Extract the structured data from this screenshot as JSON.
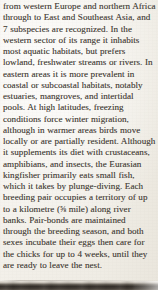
{
  "page": {
    "kind": "scanned-book-page-excerpt",
    "paper_color": "#f3f0ea",
    "ink_color": "#4c4740",
    "photo_band_color": "#342f2a"
  },
  "body": {
    "text": "from western Europe and northern Africa through to East and Southeast Asia, and 7 subspecies are recognized. In the western sector of its range it inhabits most aquatic habitats, but prefers lowland, freshwater streams or rivers. In eastern areas it is more prevalent in coastal or subcoastal habitats, notably estuaries, mangroves, and intertidal pools. At high latitudes, freezing conditions force winter migration, although in warmer areas birds move locally or are partially resident. Although it supplements its diet with crustaceans, amphibians, and insects, the Eurasian kingfisher primarily eats small fish, which it takes by plunge-diving. Each breeding pair occupies a territory of up to a kilometre (",
    "fraction": "⅝",
    "text_after_fraction": " mile) along river banks. Pair-bonds are maintained through the breeding season, and both sexes incubate their eggs then care for the chicks for up to 4 weeks, until they are ready to leave the nest.",
    "lines": [
      "from western Europe and northern",
      "Africa through to East and Southeast",
      "Asia, and 7 subspecies are recognized.",
      "In the western sector of its range it",
      "inhabits most aquatic habitats, but",
      "prefers lowland, freshwater streams",
      "or rivers. In eastern areas it is more",
      "prevalent in coastal or subcoastal",
      "habitats, notably estuaries, mangroves,",
      "and intertidal pools. At high latitudes,",
      "freezing conditions force winter",
      "migration, although in warmer areas",
      "birds move locally or are partially",
      "resident. Although it supplements its",
      "diet with crustaceans, amphibians,",
      "and insects, the Eurasian kingfisher",
      "primarily eats small fish, which it",
      "takes by plunge-diving. Each breeding",
      "pair occupies a territory of up to a",
      "kilometre (⅝ mile) along river banks.",
      "Pair-bonds are maintained through",
      "the breeding season, and both sexes",
      "incubate their eggs then care for the",
      "chicks for up to 4 weeks, until they",
      "are ready to leave the nest."
    ],
    "facts": {
      "subspecies_count": "7",
      "territory_length_metric": "a kilometre",
      "territory_length_imperial": "⅝ mile",
      "chick_care_duration": "4 weeks",
      "species": "Eurasian kingfisher",
      "hunting_method": "plunge-diving"
    }
  }
}
